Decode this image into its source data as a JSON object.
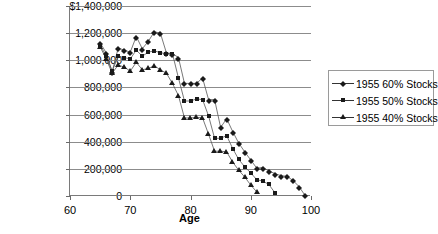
{
  "chart": {
    "title_fragment": "",
    "legend_position": "right"
  },
  "chart_data": {
    "type": "line",
    "title": "",
    "xlabel": "Age",
    "ylabel": "",
    "xlim": [
      60,
      100
    ],
    "ylim": [
      0,
      1400000
    ],
    "grid": true,
    "legend_position": "right",
    "xticks": [
      "60",
      "70",
      "80",
      "90",
      "100"
    ],
    "xtick_values": [
      60,
      70,
      80,
      90,
      100
    ],
    "yticks": [
      "0",
      "200,000",
      "400,000",
      "600,000",
      "800,000",
      "1,000,000",
      "1,200,000",
      "$1,400,000"
    ],
    "ytick_values": [
      0,
      200000,
      400000,
      600000,
      800000,
      1000000,
      1200000,
      1400000
    ],
    "series": [
      {
        "name": "1955 60% Stocks",
        "marker": "diamond",
        "x": [
          65,
          66,
          67,
          68,
          69,
          70,
          71,
          72,
          73,
          74,
          75,
          76,
          77,
          78,
          79,
          80,
          81,
          82,
          83,
          84,
          85,
          86,
          87,
          88,
          89,
          90,
          91,
          92,
          93,
          94,
          95,
          96,
          97,
          98,
          99
        ],
        "values": [
          1130000,
          1055000,
          915000,
          1090000,
          1075000,
          1060000,
          1175000,
          1085000,
          1140000,
          1210000,
          1200000,
          1055000,
          1050000,
          1020000,
          830000,
          830000,
          830000,
          870000,
          710000,
          710000,
          505000,
          570000,
          475000,
          390000,
          325000,
          265000,
          205000,
          210000,
          185000,
          165000,
          150000,
          145000,
          115000,
          70000,
          5000
        ]
      },
      {
        "name": "1955 50% Stocks",
        "marker": "square",
        "x": [
          65,
          66,
          67,
          68,
          69,
          70,
          71,
          72,
          73,
          74,
          75,
          76,
          77,
          78,
          79,
          80,
          81,
          82,
          83,
          84,
          85,
          86,
          87,
          88,
          89,
          90,
          91,
          92,
          93,
          94
        ],
        "values": [
          1115000,
          1030000,
          920000,
          1030000,
          1020000,
          1010000,
          1075000,
          1030000,
          1060000,
          1070000,
          1055000,
          1050000,
          1050000,
          870000,
          700000,
          700000,
          715000,
          710000,
          590000,
          425000,
          425000,
          445000,
          350000,
          270000,
          215000,
          170000,
          120000,
          110000,
          85000,
          25000
        ]
      },
      {
        "name": "1955 40% Stocks",
        "marker": "triangle",
        "x": [
          65,
          66,
          67,
          68,
          69,
          70,
          71,
          72,
          73,
          74,
          75,
          76,
          77,
          78,
          79,
          80,
          81,
          82,
          83,
          84,
          85,
          86,
          87,
          88,
          89,
          90,
          91
        ],
        "values": [
          1100000,
          1010000,
          905000,
          965000,
          950000,
          920000,
          985000,
          930000,
          940000,
          960000,
          930000,
          905000,
          830000,
          740000,
          575000,
          575000,
          580000,
          575000,
          455000,
          330000,
          330000,
          325000,
          250000,
          190000,
          140000,
          80000,
          30000
        ]
      }
    ]
  },
  "legend": {
    "items": [
      {
        "label": "1955 60% Stocks",
        "marker": "diamond"
      },
      {
        "label": "1955 50% Stocks",
        "marker": "square"
      },
      {
        "label": "1955 40% Stocks",
        "marker": "triangle"
      }
    ]
  },
  "axis": {
    "x_title": "Age"
  }
}
